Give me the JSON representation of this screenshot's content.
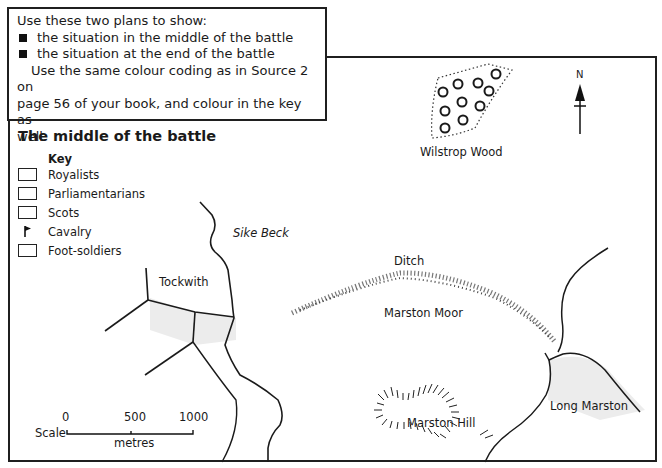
{
  "instructions": {
    "intro": "Use these two plans to show:",
    "bullets": [
      "the situation in the middle of the battle",
      "the situation at the end of the battle"
    ],
    "body_line1": "Use the same colour coding as in Source 2 on",
    "body_line2": "page 56 of your book, and colour in the key as",
    "body_line3": "well."
  },
  "map": {
    "title": "The middle of the battle",
    "key": {
      "heading": "Key",
      "items": [
        {
          "label": "Royalists",
          "symbol": "empty-box"
        },
        {
          "label": "Parliamentarians",
          "symbol": "empty-box"
        },
        {
          "label": "Scots",
          "symbol": "empty-box"
        },
        {
          "label": "Cavalry",
          "symbol": "flag-icon"
        },
        {
          "label": "Foot-soldiers",
          "symbol": "empty-box"
        }
      ]
    },
    "places": {
      "wilstrop_wood": "Wilstrop Wood",
      "sike_beck": "Sike Beck",
      "tockwith": "Tockwith",
      "ditch": "Ditch",
      "marston_moor": "Marston Moor",
      "marston_hill": "Marston Hill",
      "long_marston": "Long Marston"
    },
    "north_label": "N",
    "scale": {
      "label": "Scale",
      "ticks": [
        "0",
        "500",
        "1000"
      ],
      "unit": "metres"
    }
  }
}
